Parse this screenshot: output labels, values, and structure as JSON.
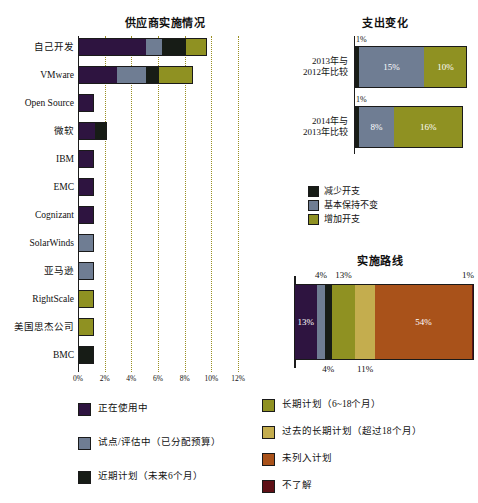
{
  "colors": {
    "in_use": "#2e1440",
    "pilot": "#6f7d93",
    "near_term": "#171c16",
    "long_term": "#8f9122",
    "past_long_term": "#c4ad4e",
    "not_planned": "#a9521a",
    "dont_know": "#5e1016",
    "decrease": "#171c16",
    "flat": "#6f7d93",
    "increase": "#8f9122",
    "grid": "#9a8f22",
    "axis": "#1c1c1c"
  },
  "chart_data": [
    {
      "type": "bar",
      "id": "vendor-implementation",
      "title": "供应商实施情况",
      "orientation": "horizontal",
      "stacked": true,
      "xlabel": "",
      "ylabel": "",
      "xlim": [
        0,
        12
      ],
      "xticks": [
        "0%",
        "2%",
        "4%",
        "6%",
        "8%",
        "10%",
        "12%"
      ],
      "xtick_values": [
        0,
        2,
        4,
        6,
        8,
        10,
        12
      ],
      "grid": true,
      "categories": [
        "自己开发",
        "VMware",
        "Open Source",
        "微软",
        "IBM",
        "EMC",
        "Cognizant",
        "SolarWinds",
        "亚马逊",
        "RightScale",
        "美国思杰公司",
        "BMC"
      ],
      "series": [
        {
          "name": "正在使用中",
          "color_key": "in_use",
          "values": [
            5.1,
            2.9,
            1.2,
            1.3,
            1.2,
            1.2,
            1.2,
            0,
            0,
            0,
            0,
            0
          ]
        },
        {
          "name": "试点/评估中（已分配预算）",
          "color_key": "pilot",
          "values": [
            1.2,
            2.2,
            0,
            0,
            0,
            0,
            0,
            1.2,
            1.2,
            0,
            0,
            0
          ]
        },
        {
          "name": "近期计划（未来6个月）",
          "color_key": "near_term",
          "values": [
            1.8,
            1.0,
            0,
            0.9,
            0,
            0,
            0,
            0,
            0,
            0,
            0,
            1.2
          ]
        },
        {
          "name": "长期计划（6~18个月）",
          "color_key": "long_term",
          "values": [
            1.6,
            2.5,
            0,
            0,
            0,
            0,
            0,
            0,
            0,
            1.2,
            1.2,
            0
          ]
        }
      ]
    },
    {
      "type": "bar",
      "id": "spending-change",
      "title": "支出变化",
      "orientation": "horizontal",
      "stacked": true,
      "grid": false,
      "categories": [
        "2013年与\n2012年比较",
        "2014年与\n2013年比较"
      ],
      "rows": [
        {
          "label_line1": "2013年与",
          "label_line2": "2012年比较",
          "outside_label": "1%",
          "segments": [
            {
              "name": "减少开支",
              "color_key": "decrease",
              "value": 1,
              "label": ""
            },
            {
              "name": "基本保持不变",
              "color_key": "flat",
              "value": 15,
              "label": "15%"
            },
            {
              "name": "增加开支",
              "color_key": "increase",
              "value": 10,
              "label": "10%"
            }
          ]
        },
        {
          "label_line1": "2014年与",
          "label_line2": "2013年比较",
          "outside_label": "1%",
          "segments": [
            {
              "name": "减少开支",
              "color_key": "decrease",
              "value": 1,
              "label": ""
            },
            {
              "name": "基本保持不变",
              "color_key": "flat",
              "value": 8,
              "label": "8%"
            },
            {
              "name": "增加开支",
              "color_key": "increase",
              "value": 16,
              "label": "16%"
            }
          ]
        }
      ],
      "legend": [
        {
          "name": "减少开支",
          "color_key": "decrease"
        },
        {
          "name": "基本保持不变",
          "color_key": "flat"
        },
        {
          "name": "增加开支",
          "color_key": "increase"
        }
      ]
    },
    {
      "type": "bar",
      "id": "implementation-roadmap",
      "title": "实施路线",
      "orientation": "horizontal",
      "stacked": true,
      "grid": false,
      "segments": [
        {
          "name": "正在使用中",
          "color_key": "in_use",
          "value": 13,
          "label": "13%",
          "label_pos": "inside"
        },
        {
          "name": "试点/评估中（已分配预算）",
          "color_key": "pilot",
          "value": 4,
          "label": "4%",
          "label_pos": "above"
        },
        {
          "name": "近期计划（未来6个月）",
          "color_key": "near_term",
          "value": 4,
          "label": "4%",
          "label_pos": "below"
        },
        {
          "name": "长期计划（6~18个月）",
          "color_key": "long_term",
          "value": 13,
          "label": "13%",
          "label_pos": "above"
        },
        {
          "name": "过去的长期计划（超过18个月）",
          "color_key": "past_long_term",
          "value": 11,
          "label": "11%",
          "label_pos": "below"
        },
        {
          "name": "未列入计划",
          "color_key": "not_planned",
          "value": 54,
          "label": "54%",
          "label_pos": "inside"
        },
        {
          "name": "不了解",
          "color_key": "dont_know",
          "value": 1,
          "label": "1%",
          "label_pos": "above"
        }
      ]
    }
  ],
  "main_legend": {
    "left_column": [
      {
        "label": "正在使用中",
        "color_key": "in_use"
      },
      {
        "label": "试点/评估中（已分配预算）",
        "color_key": "pilot"
      },
      {
        "label": "近期计划（未来6个月）",
        "color_key": "near_term"
      }
    ],
    "right_column": [
      {
        "label": "长期计划（6~18个月）",
        "color_key": "long_term"
      },
      {
        "label": "过去的长期计划（超过18个月）",
        "color_key": "past_long_term"
      },
      {
        "label": "未列入计划",
        "color_key": "not_planned"
      },
      {
        "label": "不了解",
        "color_key": "dont_know"
      }
    ]
  }
}
